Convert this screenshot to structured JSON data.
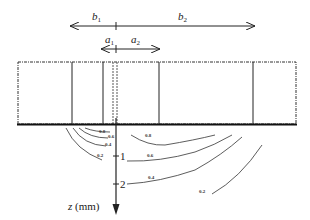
{
  "diagram": {
    "dimension_top": {
      "left_label": "b",
      "left_sub": "1",
      "right_label": "b",
      "right_sub": "2"
    },
    "dimension_bottom": {
      "left_label": "a",
      "left_sub": "1",
      "right_label": "a",
      "right_sub": "2"
    },
    "axis": {
      "label": "z (mm)",
      "ticks": [
        "1",
        "2"
      ]
    },
    "contours": {
      "left": [
        "0.8",
        "0.6",
        "0.4",
        "0.2"
      ],
      "right": [
        "0.8",
        "0.6",
        "0.4",
        "0.2"
      ]
    },
    "colors": {
      "line": "#222222",
      "dashed": "#444444"
    }
  }
}
